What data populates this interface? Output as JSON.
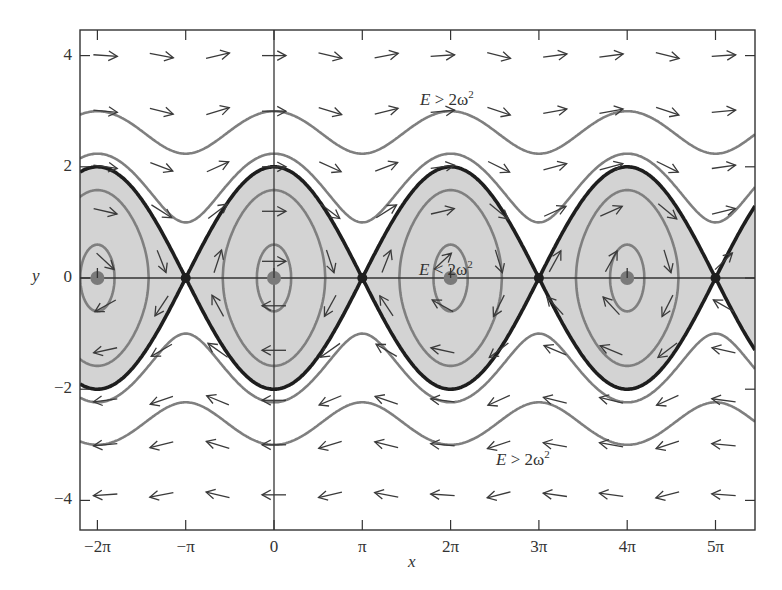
{
  "chart_data": {
    "type": "phase-portrait",
    "title": "",
    "xlabel": "x",
    "ylabel": "y",
    "xlim_pi": [
      -2.2,
      5.45
    ],
    "ylim": [
      -4.5,
      4.45
    ],
    "x_ticks": [
      {
        "value_pi": -2,
        "label": "−2π"
      },
      {
        "value_pi": -1,
        "label": "−π"
      },
      {
        "value_pi": 0,
        "label": "0"
      },
      {
        "value_pi": 1,
        "label": "π"
      },
      {
        "value_pi": 2,
        "label": "2π"
      },
      {
        "value_pi": 3,
        "label": "3π"
      },
      {
        "value_pi": 4,
        "label": "4π"
      },
      {
        "value_pi": 5,
        "label": "5π"
      }
    ],
    "y_ticks": [
      {
        "value": 4,
        "label": "4"
      },
      {
        "value": 2,
        "label": "2"
      },
      {
        "value": 0,
        "label": "0"
      },
      {
        "value": -2,
        "label": "−2"
      },
      {
        "value": -4,
        "label": "−4"
      }
    ],
    "system": "dx/dt = y, dy/dt = -ω² sin x (ω = 1)",
    "centers_pi": [
      -2,
      0,
      2,
      4
    ],
    "saddles_pi": [
      -1,
      1,
      3,
      5
    ],
    "separatrix_energy": 2,
    "closed_orbit_energies": [
      0.18,
      1.25
    ],
    "rotating_orbit_energies": [
      2.5,
      4.5
    ],
    "regions": [
      {
        "label_E": "E",
        "label_op": " > ",
        "label_rhs": "2ω",
        "label_sup": "2",
        "x_px": 420,
        "y_px": 88,
        "name": "upper-rotation-region"
      },
      {
        "label_E": "E",
        "label_op": " < ",
        "label_rhs": "2ω",
        "label_sup": "2",
        "x_px": 419,
        "y_px": 258,
        "name": "libration-region"
      },
      {
        "label_E": "E",
        "label_op": " > ",
        "label_rhs": "2ω",
        "label_sup": "2",
        "x_px": 496,
        "y_px": 448,
        "name": "lower-rotation-region"
      }
    ],
    "arrow_grid": {
      "x_start": -6.0,
      "x_step": 2.0,
      "x_count": 12,
      "y_values": [
        4.0,
        3.0,
        2.0,
        1.2,
        0.3,
        -0.5,
        -1.3,
        -2.2,
        -3.0,
        -3.9
      ]
    },
    "colors": {
      "shading": "#d3d3d3",
      "separatrix": "#1e1e1e",
      "orbit": "#7f7f7f",
      "fixed_point": "#7a7a7a",
      "arrow": "#3a3a3a",
      "axis": "#333333"
    }
  }
}
